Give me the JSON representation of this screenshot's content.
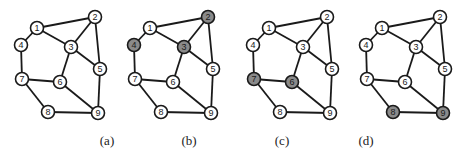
{
  "figure": {
    "colors": {
      "edge": "#1a1a1a",
      "node_fill": "#ffffff",
      "node_shaded": "#8a8a8a",
      "node_stroke": "#1a1a1a",
      "label": "#1a1a1a"
    },
    "nodes": [
      {
        "id": "1",
        "x": 37,
        "y": 28
      },
      {
        "id": "2",
        "x": 95,
        "y": 17
      },
      {
        "id": "3",
        "x": 71,
        "y": 47
      },
      {
        "id": "4",
        "x": 21,
        "y": 45
      },
      {
        "id": "5",
        "x": 100,
        "y": 69
      },
      {
        "id": "6",
        "x": 60,
        "y": 82
      },
      {
        "id": "7",
        "x": 22,
        "y": 79
      },
      {
        "id": "8",
        "x": 48,
        "y": 112
      },
      {
        "id": "9",
        "x": 98,
        "y": 113
      }
    ],
    "edges": [
      [
        "1",
        "2"
      ],
      [
        "1",
        "3"
      ],
      [
        "1",
        "4"
      ],
      [
        "2",
        "3"
      ],
      [
        "2",
        "5"
      ],
      [
        "3",
        "5"
      ],
      [
        "3",
        "6"
      ],
      [
        "4",
        "7"
      ],
      [
        "7",
        "6"
      ],
      [
        "7",
        "8"
      ],
      [
        "6",
        "9"
      ],
      [
        "5",
        "9"
      ],
      [
        "8",
        "9"
      ]
    ],
    "panels": [
      {
        "label": "(a)",
        "offset_x": 0,
        "caption_x": 107,
        "shaded": []
      },
      {
        "label": "(b)",
        "offset_x": 113,
        "caption_x": 189,
        "shaded": [
          "2",
          "3",
          "4"
        ]
      },
      {
        "label": "(c)",
        "offset_x": 232,
        "caption_x": 282,
        "shaded": [
          "6",
          "7"
        ]
      },
      {
        "label": "(d)",
        "offset_x": 345,
        "caption_x": 366,
        "shaded": [
          "8",
          "9"
        ]
      }
    ]
  }
}
